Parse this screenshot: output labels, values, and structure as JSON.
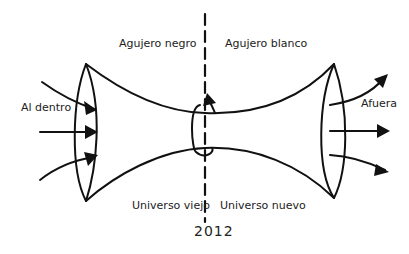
{
  "diagram": {
    "labels": {
      "black_hole": "Agujero negro",
      "white_hole": "Agujero blanco",
      "inward": "Al dentro",
      "outward": "Afuera",
      "old_universe": "Universo viejo",
      "new_universe": "Universo nuevo",
      "year": "2012"
    },
    "colors": {
      "ink": "#111111",
      "background": "#ffffff"
    }
  }
}
